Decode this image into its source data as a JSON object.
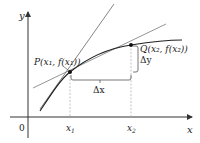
{
  "diagram": {
    "axes": {
      "x_label": "x",
      "y_label": "y",
      "origin_label": "0",
      "ticks": [
        {
          "label": "x",
          "sub": "1"
        },
        {
          "label": "x",
          "sub": "2"
        }
      ]
    },
    "points": {
      "P": {
        "name": "P",
        "label": "P(x₁, f(x₁))"
      },
      "Q": {
        "name": "Q",
        "label": "Q(x₂, f(x₂))"
      }
    },
    "increments": {
      "dx": "Δx",
      "dy": "Δy"
    },
    "colors": {
      "curve": "#222222",
      "tangent": "#777777",
      "secant": "#888888",
      "guides": "#999999",
      "axes": "#333333"
    }
  }
}
